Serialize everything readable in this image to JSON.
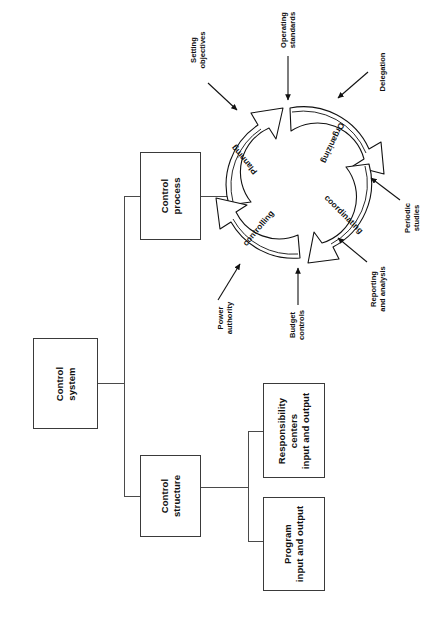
{
  "diagram": {
    "title": "Control system",
    "orientation": "rotated-90",
    "nodes": {
      "control_system": "Control\nsystem",
      "control_system_line1": "Control",
      "control_system_line2": "system",
      "control_process_line1": "Control",
      "control_process_line2": "process",
      "control_structure_line1": "Control",
      "control_structure_line2": "structure",
      "responsibility_line1": "Responsibility",
      "responsibility_line2": "centers",
      "responsibility_line3": "input and output",
      "program_line1": "Program",
      "program_line2": "input and output"
    },
    "cycle": {
      "steps": [
        {
          "id": "planning",
          "label": "Planning"
        },
        {
          "id": "organizing",
          "label": "Organizing"
        },
        {
          "id": "coordinating",
          "label": "coordinating"
        },
        {
          "id": "controlling",
          "label": "controlling"
        }
      ]
    },
    "annotations": [
      {
        "id": "setting-objectives",
        "line1": "Setting",
        "line2": "objectives"
      },
      {
        "id": "operating-standards",
        "line1": "Operating",
        "line2": "standards"
      },
      {
        "id": "delegation",
        "line1": "Delegation",
        "line2": ""
      },
      {
        "id": "periodic-studies",
        "line1": "Periodic",
        "line2": "studies"
      },
      {
        "id": "reporting-and-analysis",
        "line1": "Reporting",
        "line2": "and analysis"
      },
      {
        "id": "budget-controls",
        "line1": "Budget",
        "line2": "controls"
      },
      {
        "id": "power-authority",
        "line1": "Power",
        "line2": "authority"
      }
    ],
    "colors": {
      "ink": "#111111",
      "box_border": "#3a3a3a",
      "connector": "#4a4a4a",
      "background": "#ffffff"
    }
  }
}
